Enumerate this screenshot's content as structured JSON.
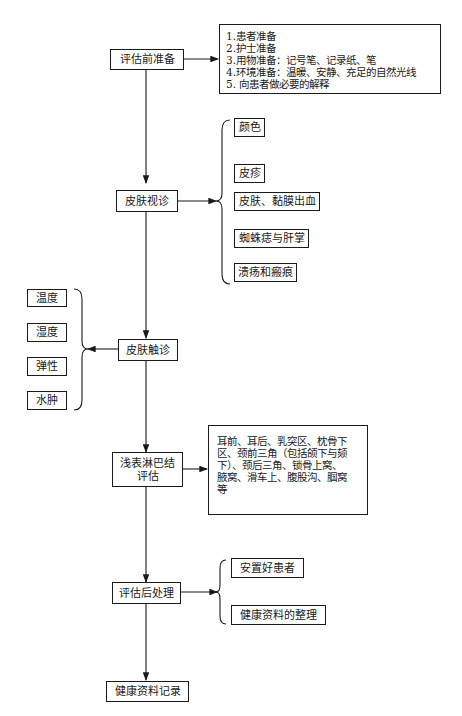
{
  "main_flow": [
    {
      "id": "pre",
      "label": "评估前准备"
    },
    {
      "id": "visual",
      "label": "皮肤视诊"
    },
    {
      "id": "palpation",
      "label": "皮肤触诊"
    },
    {
      "id": "lymph",
      "label_line1": "浅表淋巴结",
      "label_line2": "评估"
    },
    {
      "id": "post",
      "label": "评估后处理"
    },
    {
      "id": "record",
      "label": "健康资料记录"
    }
  ],
  "pre_details": [
    "1.患者准备",
    "2.护士准备",
    "3.用物准备：记号笔、记录纸、笔",
    "4.环境准备：温暖、安静、充足的自然光线",
    "5. 向患者做必要的解释"
  ],
  "visual_items": [
    "颜色",
    "皮疹",
    "皮肤、黏膜出血",
    "蜘蛛痣与肝掌",
    "溃疡和瘢痕"
  ],
  "palpation_items": [
    "温度",
    "湿度",
    "弹性",
    "水肿"
  ],
  "lymph_details": [
    "耳前、耳后、乳突区、枕骨下",
    "区、颈前三角（包括颌下与颏",
    "下）、颈后三角、锁骨上窝、",
    "腋窝、滑车上、腹股沟、腘窝",
    "等"
  ],
  "post_items": [
    "安置好患者",
    "健康资料的整理"
  ],
  "colors": {
    "line": "#1a1a1a",
    "background": "#ffffff"
  }
}
